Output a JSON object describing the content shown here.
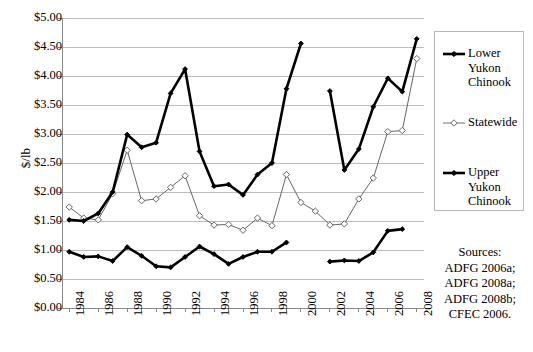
{
  "chart_data": {
    "type": "line",
    "title": "",
    "xlabel": "",
    "ylabel": "$/lb",
    "x": [
      1984,
      1985,
      1986,
      1987,
      1988,
      1989,
      1990,
      1991,
      1992,
      1993,
      1994,
      1995,
      1996,
      1997,
      1998,
      1999,
      2000,
      2001,
      2002,
      2003,
      2004,
      2005,
      2006,
      2007,
      2008
    ],
    "xlim": [
      1983.5,
      2008.5
    ],
    "ylim": [
      0,
      5
    ],
    "ytick_step": 0.5,
    "ytick_labels": [
      "$0.00",
      "$0.50",
      "$1.00",
      "$1.50",
      "$2.00",
      "$2.50",
      "$3.00",
      "$3.50",
      "$4.00",
      "$4.50",
      "$5.00"
    ],
    "ytick_values": [
      0,
      0.5,
      1.0,
      1.5,
      2.0,
      2.5,
      3.0,
      3.5,
      4.0,
      4.5,
      5.0
    ],
    "xtick_labels": [
      "1984",
      "1986",
      "1988",
      "1990",
      "1992",
      "1994",
      "1996",
      "1998",
      "2000",
      "2002",
      "2004",
      "2006",
      "2008"
    ],
    "xtick_values": [
      1984,
      1986,
      1988,
      1990,
      1992,
      1994,
      1996,
      1998,
      2000,
      2002,
      2004,
      2006,
      2008
    ],
    "grid": "horizontal",
    "legend_position": "right-outside",
    "series": [
      {
        "name": "Lower Yukon Chinook",
        "marker": "filled-diamond",
        "line_width": 2.6,
        "color": "#000000",
        "values": [
          1.52,
          1.5,
          1.63,
          2.0,
          2.99,
          2.77,
          2.85,
          3.7,
          4.12,
          2.7,
          2.1,
          2.13,
          1.95,
          2.3,
          2.5,
          3.78,
          4.56,
          null,
          3.74,
          2.38,
          2.74,
          3.47,
          3.96,
          3.73,
          4.64
        ]
      },
      {
        "name": "Statewide",
        "marker": "open-diamond",
        "line_width": 1.0,
        "color": "#666666",
        "values": [
          1.74,
          1.55,
          1.52,
          1.97,
          2.72,
          1.85,
          1.88,
          2.08,
          2.28,
          1.59,
          1.43,
          1.44,
          1.34,
          1.55,
          1.42,
          2.3,
          1.82,
          1.67,
          1.43,
          1.45,
          1.88,
          2.24,
          3.04,
          3.06,
          4.3
        ]
      },
      {
        "name": "Upper Yukon Chinook",
        "marker": "filled-diamond",
        "line_width": 2.6,
        "color": "#000000",
        "values": [
          0.97,
          0.88,
          0.89,
          0.81,
          1.05,
          0.9,
          0.72,
          0.7,
          0.88,
          1.06,
          0.93,
          0.76,
          0.88,
          0.97,
          0.97,
          1.13,
          null,
          null,
          0.8,
          0.82,
          0.81,
          0.96,
          1.33,
          1.36,
          null
        ]
      }
    ]
  },
  "legend": {
    "entries": [
      {
        "label_lines": [
          "Lower",
          "Yukon",
          "Chinook"
        ],
        "symbol": "filled-diamond-thick"
      },
      {
        "label_lines": [
          "Statewide"
        ],
        "symbol": "open-diamond-thin"
      },
      {
        "label_lines": [
          "Upper",
          "Yukon",
          "Chinook"
        ],
        "symbol": "filled-diamond-thick"
      }
    ]
  },
  "sources": {
    "lines": [
      "Sources:",
      "ADFG 2006a;",
      "ADFG 2008a;",
      "ADFG 2008b;",
      "CFEC 2006."
    ]
  },
  "colors": {
    "axis": "#888888",
    "grid": "#bcbcbc",
    "series_dark": "#000000",
    "series_light": "#6e6e6e",
    "legend_border": "#b9b9b9",
    "background": "#ffffff"
  }
}
